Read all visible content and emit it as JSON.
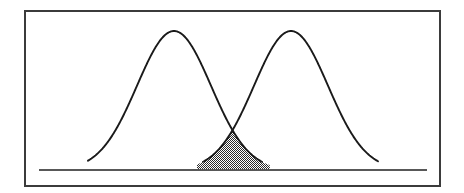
{
  "figure": {
    "name": "overlapping-normal-distributions",
    "canvas": {
      "width": 464,
      "height": 193,
      "background": "#ffffff"
    },
    "frame": {
      "name": "plot-frame",
      "x": 25,
      "y": 11,
      "width": 415,
      "height": 175,
      "stroke": "#3b3b3b",
      "stroke_width": 2,
      "fill": "none"
    },
    "baseline": {
      "name": "baseline-axis",
      "x1": 39,
      "y1": 170,
      "x2": 427,
      "y2": 170,
      "stroke": "#585858",
      "stroke_width": 2
    },
    "curve_style": {
      "stroke": "#1a1a1a",
      "stroke_width": 1.9,
      "fill": "none"
    },
    "shading": {
      "name": "overlap-shading",
      "pattern": "stipple-checkerboard",
      "dot_color": "#2b2b2b",
      "background_color": "#ffffff",
      "cell_size": 2,
      "opacity": 1
    }
  },
  "chart_data": {
    "type": "line",
    "title": "",
    "subtitle": "",
    "xlabel": "",
    "ylabel": "",
    "grid": false,
    "legend": false,
    "axis": {
      "x_visible": true,
      "y_visible": false,
      "x_ticks": [],
      "y_ticks": [],
      "xlim": [
        25,
        440
      ],
      "ylim": [
        0,
        1
      ]
    },
    "series": [
      {
        "name": "distribution-a",
        "kind": "normal-pdf",
        "mean_px": 174,
        "peak_y_px": 31,
        "baseline_y_px": 170,
        "sigma_px": 37,
        "left_tail_px": 88,
        "right_tail_px": 262,
        "stroke": "#1a1a1a"
      },
      {
        "name": "distribution-b",
        "kind": "normal-pdf",
        "mean_px": 291,
        "peak_y_px": 31,
        "baseline_y_px": 170,
        "sigma_px": 37,
        "left_tail_px": 203,
        "right_tail_px": 378,
        "stroke": "#1a1a1a"
      }
    ],
    "annotations": [
      {
        "name": "intersection-point",
        "x_px": 232,
        "y_px": 142,
        "label": ""
      },
      {
        "name": "overlap-region",
        "shaded": true,
        "x_start_px": 197,
        "x_end_px": 270,
        "apex_x_px": 232,
        "apex_y_px": 142,
        "label": ""
      }
    ]
  }
}
